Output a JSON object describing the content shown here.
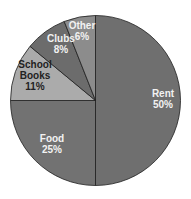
{
  "chart_data": {
    "type": "pie",
    "title": "",
    "categories": [
      "Rent",
      "Food",
      "School Books",
      "Clubs",
      "Other"
    ],
    "values": [
      50,
      25,
      11,
      8,
      6
    ],
    "unit": "%",
    "start_angle_deg": 0,
    "direction": "clockwise from 12 o'clock",
    "labels": [
      {
        "lines": [
          "Rent",
          "50%"
        ]
      },
      {
        "lines": [
          "Food",
          "25%"
        ]
      },
      {
        "lines": [
          "School",
          "Books",
          "11%"
        ]
      },
      {
        "lines": [
          "Clubs",
          "8%"
        ]
      },
      {
        "lines": [
          "Other",
          "6%"
        ]
      }
    ],
    "colors": [
      "#6f6f6f",
      "#727272",
      "#ababab",
      "#6c6c6c",
      "#8c8c8c"
    ],
    "label_colors": [
      "#f2f2f2",
      "#f2f2f2",
      "#222222",
      "#f2f2f2",
      "#f2f2f2"
    ],
    "stroke_color": "#1e1e1e",
    "legend": "none"
  }
}
